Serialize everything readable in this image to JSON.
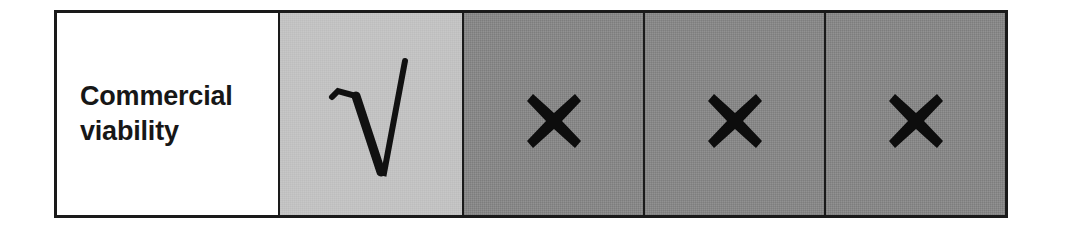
{
  "figure": {
    "type": "comparison-matrix-row",
    "criterion_label": "Commercial\nviability",
    "row_border_color": "#1a1a1a"
  },
  "cells": [
    {
      "kind": "label",
      "name": "criterion-label-cell",
      "text": "Commercial\nviability",
      "background": "#ffffff",
      "mark": "none",
      "mark_label": ""
    },
    {
      "kind": "rating",
      "name": "rating-cell-1",
      "text": "",
      "background": "#c6c6c6",
      "mark": "check-radical",
      "mark_label": "√"
    },
    {
      "kind": "rating",
      "name": "rating-cell-2",
      "text": "",
      "background": "#8a8a8a",
      "mark": "cross",
      "mark_label": "✖"
    },
    {
      "kind": "rating",
      "name": "rating-cell-3",
      "text": "",
      "background": "#8a8a8a",
      "mark": "cross",
      "mark_label": "✖"
    },
    {
      "kind": "rating",
      "name": "rating-cell-4",
      "text": "",
      "background": "#8a8a8a",
      "mark": "cross",
      "mark_label": "✖"
    }
  ],
  "colors": {
    "white": "#ffffff",
    "light_gray": "#c6c6c6",
    "dark_gray": "#8a8a8a",
    "ink": "#1a1a1a",
    "text": "#171717"
  }
}
